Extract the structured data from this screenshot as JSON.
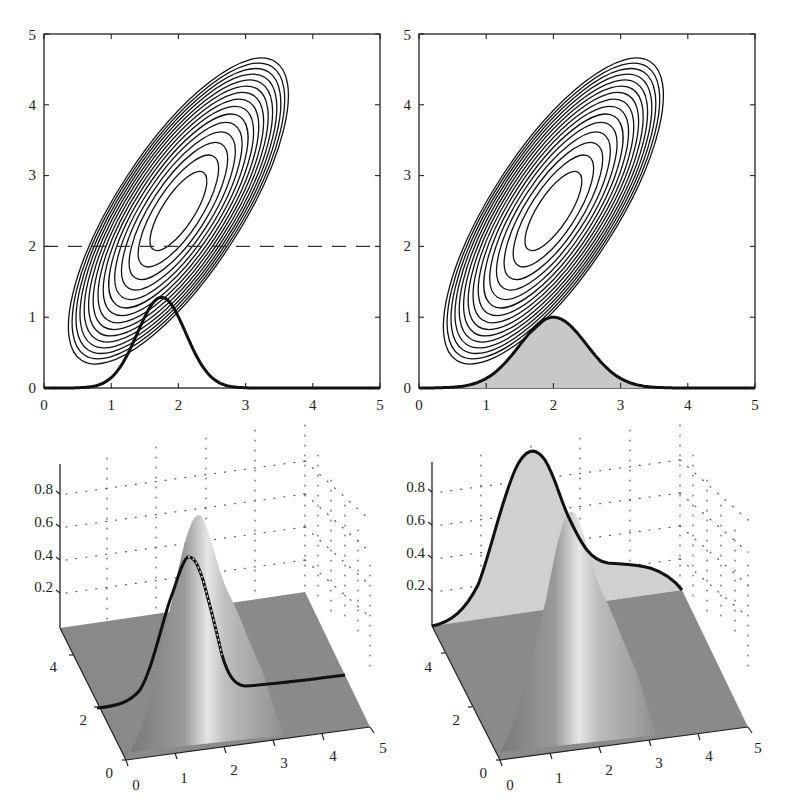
{
  "chart_data": [
    {
      "panel": "top-left",
      "type": "contour",
      "title": "",
      "xlabel": "",
      "ylabel": "",
      "xlim": [
        0,
        5
      ],
      "ylim": [
        0,
        5
      ],
      "x_ticks": [
        "0",
        "1",
        "2",
        "3",
        "4",
        "5"
      ],
      "y_ticks": [
        "0",
        "1",
        "2",
        "3",
        "4",
        "5"
      ],
      "grid": false,
      "contours": {
        "center": [
          2.0,
          2.5
        ],
        "levels": 15,
        "orientation": "tilted, major axis along positive diagonal",
        "outer_extent_x": [
          0.7,
          3.3
        ],
        "outer_extent_y": [
          0.3,
          4.6
        ]
      },
      "reference_line": {
        "style": "dashed",
        "y": 2.0
      },
      "curve": {
        "name": "conditional density (slice at y=2)",
        "style": "bold line",
        "peak_x": 1.75,
        "peak_y": 1.28,
        "support": [
          0.7,
          2.9
        ],
        "x": [
          0,
          0.5,
          0.8,
          1.0,
          1.2,
          1.4,
          1.6,
          1.75,
          1.9,
          2.1,
          2.3,
          2.5,
          2.7,
          3.0,
          3.5,
          5
        ],
        "y": [
          0,
          0.0,
          0.05,
          0.22,
          0.55,
          0.95,
          1.22,
          1.28,
          1.2,
          0.9,
          0.52,
          0.22,
          0.06,
          0.0,
          0,
          0
        ]
      }
    },
    {
      "panel": "top-right",
      "type": "contour",
      "title": "",
      "xlabel": "",
      "ylabel": "",
      "xlim": [
        0,
        5
      ],
      "ylim": [
        0,
        5
      ],
      "x_ticks": [
        "0",
        "1",
        "2",
        "3",
        "4",
        "5"
      ],
      "y_ticks": [
        "0",
        "1",
        "2",
        "3",
        "4",
        "5"
      ],
      "grid": false,
      "contours": {
        "center": [
          2.0,
          2.5
        ],
        "levels": 15,
        "orientation": "tilted, major axis along positive diagonal",
        "outer_extent_x": [
          0.7,
          3.3
        ],
        "outer_extent_y": [
          0.3,
          4.6
        ]
      },
      "curve": {
        "name": "marginal density",
        "style": "bold line, gray filled area",
        "fill_color": "#c8c8c8",
        "peak_x": 2.0,
        "peak_y": 1.0,
        "x": [
          0,
          0.5,
          0.8,
          1.0,
          1.2,
          1.4,
          1.6,
          1.8,
          2.0,
          2.2,
          2.4,
          2.6,
          2.8,
          3.0,
          3.3,
          3.6,
          4.0,
          5
        ],
        "y": [
          0,
          0.02,
          0.08,
          0.17,
          0.32,
          0.5,
          0.72,
          0.9,
          1.0,
          0.9,
          0.72,
          0.5,
          0.32,
          0.17,
          0.05,
          0.01,
          0,
          0
        ]
      }
    },
    {
      "panel": "bottom-left",
      "type": "surface3d",
      "title": "",
      "x_ticks": [
        "0",
        "1",
        "2",
        "3",
        "4",
        "5"
      ],
      "y_ticks": [
        "0",
        "2",
        "4"
      ],
      "z_ticks": [
        "0.2",
        "0.4",
        "0.6",
        "0.8"
      ],
      "grid": "dotted",
      "surface": {
        "shape": "bivariate gaussian ridge",
        "peak_z": 0.65,
        "color": "#8c8c8c"
      },
      "slice_curve": {
        "style": "bold line along surface at y=2",
        "peak_z": 0.42
      }
    },
    {
      "panel": "bottom-right",
      "type": "surface3d",
      "title": "",
      "x_ticks": [
        "0",
        "1",
        "2",
        "3",
        "4",
        "5"
      ],
      "y_ticks": [
        "0",
        "2",
        "4"
      ],
      "z_ticks": [
        "0.2",
        "0.4",
        "0.6",
        "0.8"
      ],
      "grid": "dotted",
      "surface": {
        "shape": "bivariate gaussian ridge",
        "peak_z": 0.65,
        "color": "#8c8c8c"
      },
      "marginal_curve": {
        "style": "bold line with light gray fill, projected on back wall",
        "peak_z": 1.0,
        "fill_color": "#d0d0d0"
      }
    }
  ],
  "axes": {
    "top_left": {
      "x_ticks": [
        "0",
        "1",
        "2",
        "3",
        "4",
        "5"
      ],
      "y_ticks": [
        "0",
        "1",
        "2",
        "3",
        "4",
        "5"
      ]
    },
    "top_right": {
      "x_ticks": [
        "0",
        "1",
        "2",
        "3",
        "4",
        "5"
      ],
      "y_ticks": [
        "0",
        "1",
        "2",
        "3",
        "4",
        "5"
      ]
    },
    "bottom_left": {
      "x_ticks": [
        "0",
        "1",
        "2",
        "3",
        "4",
        "5"
      ],
      "y_ticks": [
        "0",
        "2",
        "4"
      ],
      "z_ticks": [
        "0.2",
        "0.4",
        "0.6",
        "0.8"
      ]
    },
    "bottom_right": {
      "x_ticks": [
        "0",
        "1",
        "2",
        "3",
        "4",
        "5"
      ],
      "y_ticks": [
        "0",
        "2",
        "4"
      ],
      "z_ticks": [
        "0.2",
        "0.4",
        "0.6",
        "0.8"
      ]
    }
  }
}
